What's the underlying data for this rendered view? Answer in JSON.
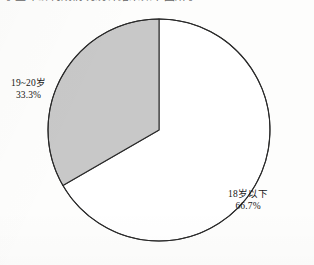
{
  "page": {
    "background_color": "#fdfdfc",
    "cropped_top_line": "学生年龄构成情况统计结果如下图所示"
  },
  "chart_data": {
    "type": "pie",
    "title": "",
    "subtitle": "",
    "xlabel": "",
    "ylabel": "",
    "legend_position": "none",
    "grid": false,
    "start_angle_deg": 90,
    "direction": "counterclockwise",
    "total_percent": 100.0,
    "categories": [
      "18岁以下",
      "19~20岁"
    ],
    "values": [
      66.7,
      33.3
    ],
    "labels": [
      "66.7%",
      "33.3%"
    ],
    "slices": [
      {
        "name": "major-slice",
        "category": "18岁以下",
        "value": 66.7,
        "value_label": "66.7%",
        "sweep_deg": 240.0,
        "fill": "#ffffff",
        "stroke": "#2a2a2a"
      },
      {
        "name": "minor-slice",
        "category": "19~20岁",
        "value": 33.3,
        "value_label": "33.3%",
        "sweep_deg": 120.0,
        "fill": "#c8c8c8",
        "stroke": "#2a2a2a"
      }
    ],
    "colors": {
      "slice_gray": "#c8c8c8",
      "slice_white": "#ffffff",
      "outline": "#2a2a2a",
      "text": "#161616"
    },
    "geometry": {
      "center_x": 159,
      "center_y": 130,
      "radius": 111
    }
  },
  "labels": {
    "minor": {
      "name": "19~20岁",
      "percent": "33.3%"
    },
    "major": {
      "name": "18岁以下",
      "percent": "66.7%"
    }
  }
}
